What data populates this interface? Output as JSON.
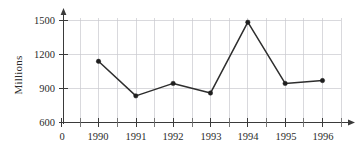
{
  "chart_data": {
    "type": "line",
    "title": "",
    "subtitle": "",
    "xlabel": "",
    "ylabel": "Millions",
    "categories": [
      "1990",
      "1991",
      "1992",
      "1993",
      "1994",
      "1995",
      "1996"
    ],
    "values": [
      1140,
      835,
      945,
      860,
      1485,
      945,
      970
    ],
    "series": [
      {
        "name": "Millions",
        "values": [
          1140,
          835,
          945,
          860,
          1485,
          945,
          970
        ]
      }
    ],
    "x_tick_labels": [
      "0",
      "1990",
      "1991",
      "1992",
      "1993",
      "1994",
      "1995",
      "1996"
    ],
    "y_tick_labels": [
      "600",
      "900",
      "1200",
      "1500"
    ],
    "y_ticks": [
      600,
      900,
      1200,
      1500
    ],
    "ylim": [
      600,
      1560
    ],
    "xlim_labels": [
      "0",
      "1996"
    ],
    "grid": "vertical-and-horizontal",
    "legend": "none",
    "legend_position": "none",
    "minor_x_ticks_per_interval": 1,
    "marker": "filled-circle",
    "annotations": []
  },
  "axes": {
    "y_axis_label": "Millions",
    "y_axis_arrow": "up-arrow",
    "x_axis_arrow": "right-arrow"
  },
  "colors": {
    "line": "#2e2e2e",
    "marker": "#1f1f1f",
    "grid": "#c9c9cf",
    "axis": "#3a3a3a",
    "text": "#2b2b2b",
    "background": "#ffffff"
  }
}
